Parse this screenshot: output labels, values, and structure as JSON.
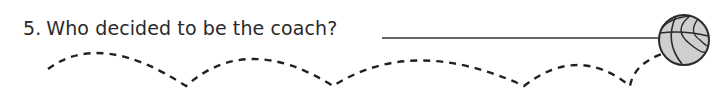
{
  "question": {
    "number": "5.",
    "text": "Who decided to be the coach?"
  },
  "answer_line": {
    "x1": 382,
    "x2": 660,
    "y": 38,
    "color": "#333333"
  },
  "basketball": {
    "cx": 684,
    "cy": 40,
    "r": 25,
    "fill": "#cfcfcf",
    "stroke": "#2b2b2b"
  },
  "bounce_path": {
    "color": "#222222",
    "dash": "7 6",
    "d": "M 48 69 Q 100 30 186 86 Q 247 32 333 86 Q 413 35 524 86 Q 578 44 630 86 Q 634 64 662 54"
  }
}
